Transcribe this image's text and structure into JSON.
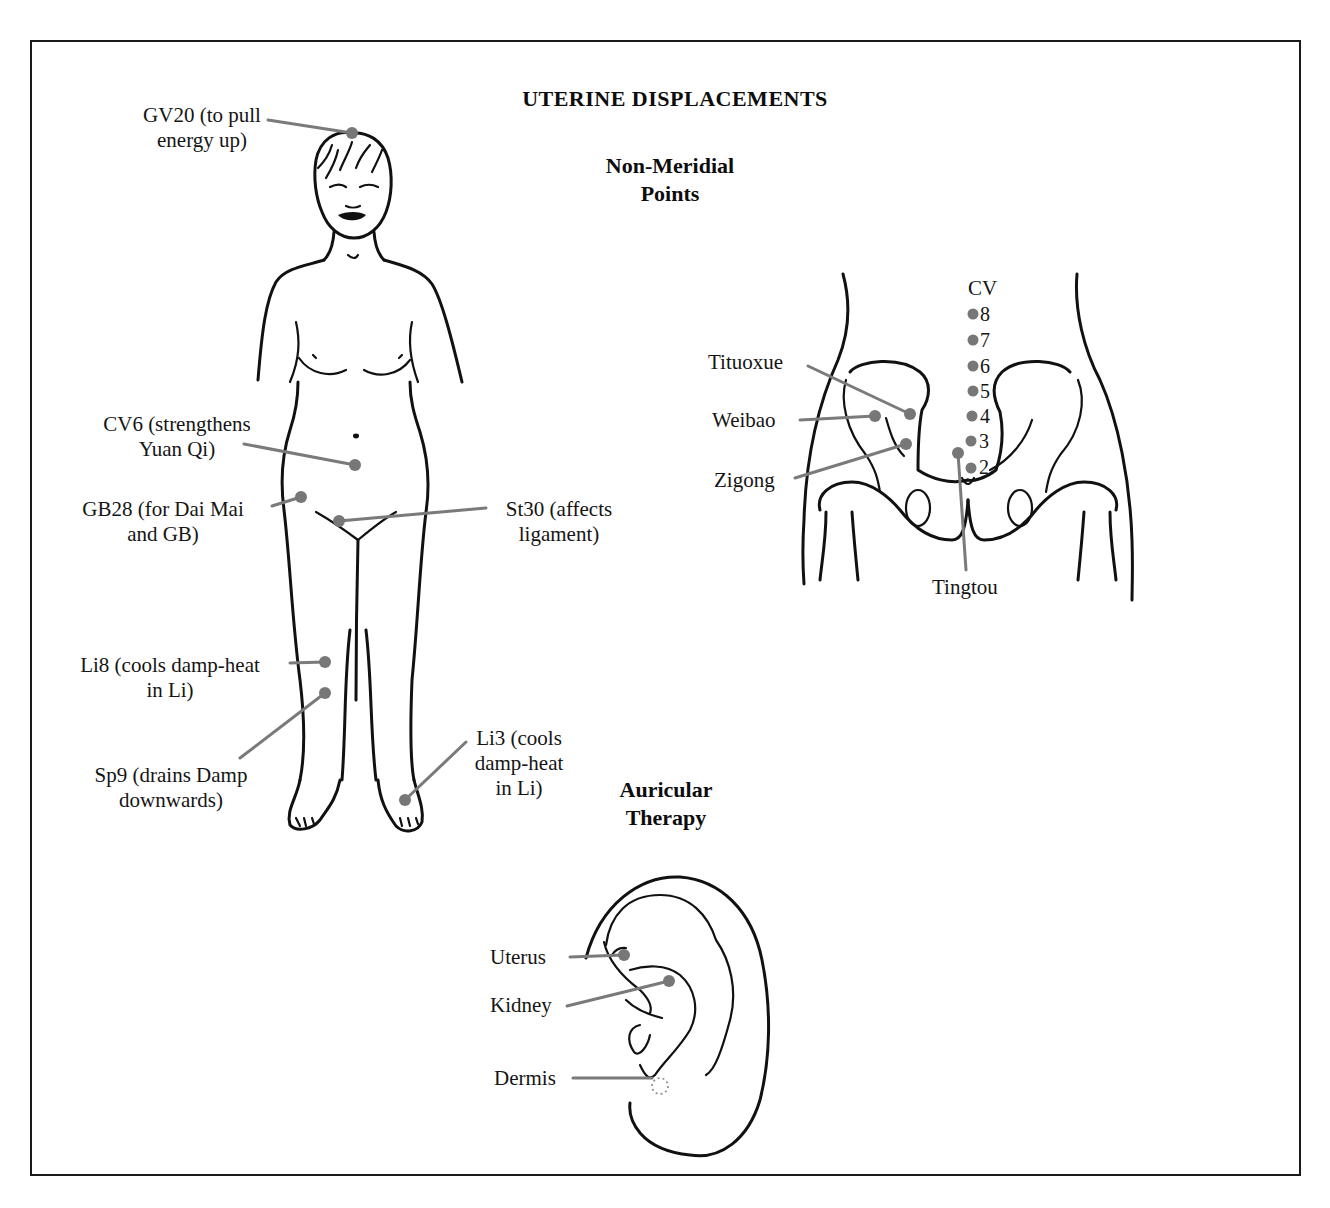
{
  "title": "UTERINE DISPLACEMENTS",
  "colors": {
    "point": "#777777",
    "leader": "#7a7a7a",
    "ink": "#111111",
    "frame": "#1a1a1a"
  },
  "sections": {
    "non_meridial": {
      "line1": "Non-Meridial",
      "line2": "Points"
    },
    "auricular": {
      "line1": "Auricular",
      "line2": "Therapy"
    }
  },
  "body_points": [
    {
      "id": "GV20",
      "line1": "GV20 (to pull",
      "line2": "energy up)"
    },
    {
      "id": "CV6",
      "line1": "CV6 (strengthens",
      "line2": "Yuan Qi)"
    },
    {
      "id": "GB28",
      "line1": "GB28 (for Dai Mai",
      "line2": "and GB)"
    },
    {
      "id": "St30",
      "line1": "St30 (affects",
      "line2": "ligament)"
    },
    {
      "id": "Li8",
      "line1": "Li8 (cools damp-heat",
      "line2": "in Li)"
    },
    {
      "id": "Sp9",
      "line1": "Sp9 (drains Damp",
      "line2": "downwards)"
    },
    {
      "id": "Li3",
      "line1": "Li3 (cools",
      "line2": "damp-heat",
      "line3": "in Li)"
    }
  ],
  "pelvis_points": {
    "cv_label": "CV",
    "cv_numbers": [
      "8",
      "7",
      "6",
      "5",
      "4",
      "3",
      "2"
    ],
    "named": [
      {
        "id": "tituoxue",
        "label": "Tituoxue"
      },
      {
        "id": "weibao",
        "label": "Weibao"
      },
      {
        "id": "zigong",
        "label": "Zigong"
      },
      {
        "id": "tingtou",
        "label": "Tingtou"
      }
    ]
  },
  "ear_points": [
    {
      "id": "uterus",
      "label": "Uterus"
    },
    {
      "id": "kidney",
      "label": "Kidney"
    },
    {
      "id": "dermis",
      "label": "Dermis"
    }
  ]
}
